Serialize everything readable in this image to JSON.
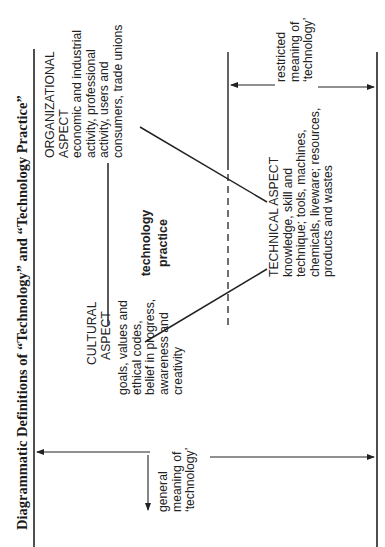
{
  "title": "Diagrammatic Definitions of “Technology” and “Technology Practice”",
  "cultural": {
    "heading": [
      "CULTURAL",
      "ASPECT"
    ],
    "lines": [
      "goals, values and",
      "ethical codes,",
      "belief in progress,",
      "awareness and",
      "creativity"
    ]
  },
  "organizational": {
    "heading": [
      "ORGANIZATIONAL",
      "ASPECT"
    ],
    "lines": [
      "economic and industrial",
      "activity, professional",
      "activity, users and",
      "consumers, trade unions"
    ]
  },
  "technical": {
    "heading": "TECHNICAL ASPECT",
    "lines": [
      "knowledge, skill and",
      "technique; tools, machines,",
      "chemicals, liveware; resources,",
      "products and wastes"
    ]
  },
  "center": [
    "technology",
    "practice"
  ],
  "general_meaning": [
    "general",
    "meaning of",
    "‘technology’"
  ],
  "restricted_meaning": [
    "restricted",
    "meaning of",
    "‘technology’"
  ]
}
